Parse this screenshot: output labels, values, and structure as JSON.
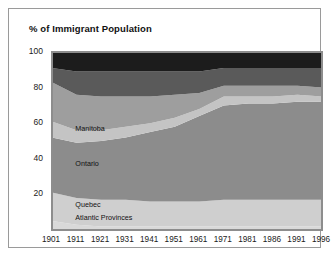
{
  "chart_data": {
    "type": "area",
    "title": "% of Immigrant Population",
    "xlabel": "",
    "ylabel": "",
    "ylim": [
      0,
      100
    ],
    "yticks": [
      20,
      40,
      60,
      80,
      100
    ],
    "grid": false,
    "legend_position": "inline-annotations",
    "stacked": true,
    "categories": [
      "1901",
      "1911",
      "1921",
      "1931",
      "1941",
      "1951",
      "1961",
      "1971",
      "1981",
      "1986",
      "1991",
      "1996"
    ],
    "series": [
      {
        "name": "Atlantic Provinces",
        "color": "#d9d9d9",
        "values": [
          5,
          3,
          2,
          2,
          2,
          2,
          2,
          2,
          2,
          2,
          2,
          2
        ]
      },
      {
        "name": "Quebec",
        "color": "#cfcfcf",
        "values": [
          16,
          15,
          15,
          15,
          14,
          14,
          14,
          15,
          15,
          15,
          15,
          15
        ]
      },
      {
        "name": "Ontario",
        "color": "#8c8c8c",
        "values": [
          31,
          31,
          33,
          35,
          39,
          42,
          48,
          53,
          54,
          54,
          55,
          55
        ]
      },
      {
        "name": "Manitoba",
        "color": "#c4c4c4",
        "values": [
          9,
          7,
          6,
          6,
          5,
          5,
          4,
          5,
          4,
          4,
          4,
          3
        ]
      },
      {
        "name": "Prairies",
        "color": "#9e9e9e",
        "values": [
          22,
          20,
          19,
          17,
          15,
          13,
          9,
          6,
          6,
          6,
          5,
          5
        ]
      },
      {
        "name": "British Columbia",
        "color": "#5a5a5a",
        "values": [
          8,
          13,
          14,
          14,
          14,
          13,
          12,
          10,
          10,
          10,
          10,
          11
        ]
      },
      {
        "name": "Territories",
        "color": "#1c1c1c",
        "values": [
          9,
          11,
          11,
          11,
          11,
          11,
          11,
          9,
          9,
          9,
          9,
          9
        ]
      }
    ],
    "annotations": [
      {
        "text": "Manitoba",
        "x_frac": 0.09,
        "y_value": 57
      },
      {
        "text": "Ontario",
        "x_frac": 0.09,
        "y_value": 37
      },
      {
        "text": "Quebec",
        "x_frac": 0.09,
        "y_value": 14
      },
      {
        "text": "Atlantic Provinces",
        "x_frac": 0.09,
        "y_value": 7
      }
    ]
  },
  "colors": {
    "frame_border": "#9a9a9a",
    "plot_border": "#8d8d8d",
    "text": "#1a1a1a",
    "background": "#ffffff"
  }
}
